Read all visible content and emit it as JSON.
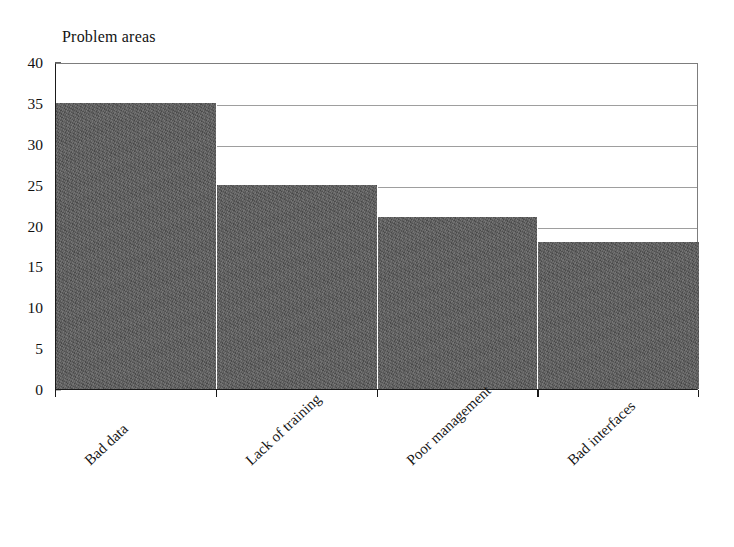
{
  "chart_data": {
    "type": "bar",
    "title": "Problem areas",
    "xlabel": "",
    "ylabel": "",
    "categories": [
      "Bad data",
      "Lack of training",
      "Poor management",
      "Bad interfaces"
    ],
    "values": [
      35,
      25,
      21,
      18
    ],
    "ylim": [
      0,
      40
    ],
    "ytick_labels": [
      "0",
      "5",
      "10",
      "15",
      "20",
      "25",
      "30",
      "35",
      "40"
    ],
    "ytick_values": [
      0,
      5,
      10,
      15,
      20,
      25,
      30,
      35,
      40
    ],
    "grid": true,
    "grid_axis": "y",
    "legend": false,
    "legend_position": "none",
    "bar_color": "#585858",
    "grid_color": "#8d8d8d",
    "axis_color": "#1b1b1b",
    "background_color": "#ffffff",
    "xtick_label_rotation": -43
  }
}
